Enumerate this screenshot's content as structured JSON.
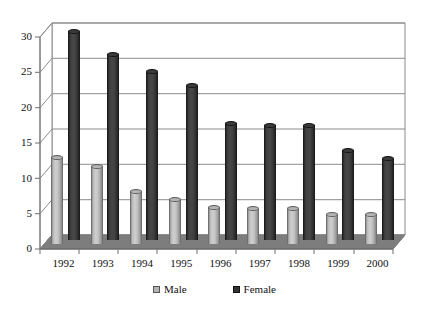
{
  "chart_data": {
    "type": "bar",
    "title": "",
    "subtitle": "",
    "xlabel": "",
    "ylabel": "",
    "categories": [
      "1992",
      "1993",
      "1994",
      "1995",
      "1996",
      "1997",
      "1998",
      "1999",
      "2000"
    ],
    "series": [
      {
        "name": "Male",
        "color": "#b4b4b4",
        "values": [
          12.3,
          11.0,
          7.5,
          6.3,
          5.2,
          5.0,
          5.0,
          4.2,
          4.2
        ]
      },
      {
        "name": "Female",
        "color": "#333333",
        "values": [
          29.5,
          26.3,
          23.8,
          21.8,
          16.5,
          16.2,
          16.2,
          12.7,
          11.5
        ]
      }
    ],
    "ylim": [
      0,
      30
    ],
    "yticks": [
      "0",
      "5",
      "10",
      "15",
      "20",
      "25",
      "30"
    ],
    "ytick_values": [
      0,
      5,
      10,
      15,
      20,
      25,
      30
    ],
    "grid": true,
    "grid_axis": "y",
    "legend_position": "bottom",
    "three_d": true,
    "annotations": []
  },
  "legend": {
    "items": [
      {
        "label": "Male",
        "marker": "square-swatch-light"
      },
      {
        "label": "Female",
        "marker": "square-swatch-dark"
      }
    ]
  },
  "colors": {
    "male": "#b4b4b4",
    "female": "#333333",
    "grid": "#8c8c8c",
    "axis": "#6e6e6e",
    "floor": "#7d7d7d",
    "background": "#ffffff"
  }
}
